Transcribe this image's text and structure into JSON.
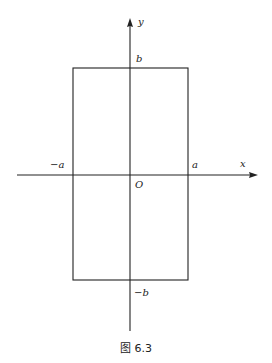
{
  "figure": {
    "caption": "图 6.3",
    "axes": {
      "x_label": "x",
      "y_label": "y",
      "origin_label": "O"
    },
    "ticks": {
      "x_neg": "−a",
      "x_pos": "a",
      "y_pos": "b",
      "y_neg": "−b"
    },
    "shape": "rectangle",
    "rectangle": {
      "x_range": [
        "-a",
        "a"
      ],
      "y_range": [
        "-b",
        "b"
      ]
    },
    "colors": {
      "stroke": "#222222",
      "background": "#ffffff"
    }
  }
}
